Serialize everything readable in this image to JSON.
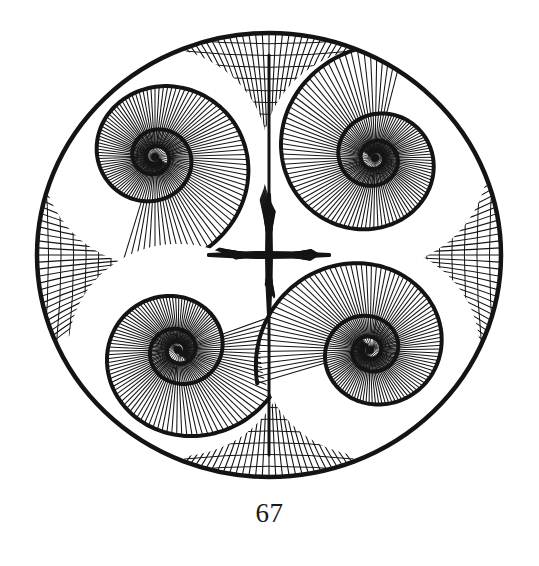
{
  "page": {
    "page_number": "67",
    "background": "#ffffff",
    "ink_color": "#141414"
  },
  "figure": {
    "outer_circle": {
      "cx": 269,
      "cy": 255,
      "rx": 232,
      "ry": 222,
      "stroke_width": 4.5
    },
    "spirals": [
      {
        "id": "top-left",
        "cx": 155,
        "cy": 157,
        "turns": 3.2,
        "r_max": 122,
        "direction": 1,
        "phase": 0.6
      },
      {
        "id": "top-right",
        "cx": 375,
        "cy": 158,
        "turns": 3.2,
        "r_max": 122,
        "direction": 1,
        "phase": 3.7
      },
      {
        "id": "bottom-left",
        "cx": 178,
        "cy": 350,
        "turns": 3.2,
        "r_max": 118,
        "direction": -1,
        "phase": 0.9
      },
      {
        "id": "bottom-right",
        "cx": 370,
        "cy": 350,
        "turns": 3.2,
        "r_max": 118,
        "direction": -1,
        "phase": 4.1
      }
    ],
    "spokes_per_spiral": 110,
    "center_cross": {
      "cx": 269,
      "cy": 255
    },
    "cusp_grids": [
      {
        "id": "top",
        "apex_x": 269,
        "apex_y": 255,
        "edge": "top"
      },
      {
        "id": "bottom",
        "apex_x": 269,
        "apex_y": 255,
        "edge": "bottom"
      },
      {
        "id": "left",
        "apex_x": 269,
        "apex_y": 255,
        "edge": "left"
      },
      {
        "id": "right",
        "apex_x": 269,
        "apex_y": 255,
        "edge": "right"
      }
    ]
  }
}
